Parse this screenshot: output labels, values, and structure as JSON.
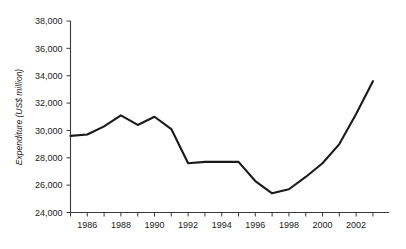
{
  "chart_data": {
    "type": "line",
    "title": "",
    "subtitle": "",
    "xlabel": "",
    "ylabel": "Expenditure (US$ million)",
    "x": [
      1985,
      1986,
      1987,
      1988,
      1989,
      1990,
      1991,
      1992,
      1993,
      1994,
      1995,
      1996,
      1997,
      1998,
      1999,
      2000,
      2001,
      2002,
      2003
    ],
    "values": [
      29600,
      29700,
      30300,
      31100,
      30400,
      31000,
      30100,
      27600,
      27700,
      27700,
      27700,
      26300,
      25400,
      25700,
      26600,
      27600,
      29000,
      31200,
      33600
    ],
    "series": [
      {
        "name": "Expenditure",
        "values": [
          29600,
          29700,
          30300,
          31100,
          30400,
          31000,
          30100,
          27600,
          27700,
          27700,
          27700,
          26300,
          25400,
          25700,
          26600,
          27600,
          29000,
          31200,
          33600
        ],
        "color": "#1a1a1a"
      }
    ],
    "xlim": [
      1985,
      2003.6
    ],
    "ylim": [
      24000,
      38000
    ],
    "ytick_values": [
      24000,
      26000,
      28000,
      30000,
      32000,
      34000,
      36000,
      38000
    ],
    "ytick_labels": [
      "24,000",
      "26,000",
      "28,000",
      "30,000",
      "32,000",
      "34,000",
      "36,000",
      "38,000"
    ],
    "xtick_values": [
      1986,
      1988,
      1990,
      1992,
      1994,
      1996,
      1998,
      2000,
      2002
    ],
    "xtick_labels": [
      "1986",
      "1988",
      "1990",
      "1992",
      "1994",
      "1996",
      "1998",
      "2000",
      "2002"
    ],
    "xminor_tick_values": [
      1985,
      1987,
      1989,
      1991,
      1993,
      1995,
      1997,
      1999,
      2001,
      2003
    ],
    "grid": false,
    "legend": "none",
    "line_color": "#1a1a1a",
    "axis_color": "#3a3a3a",
    "background_color": "#ffffff",
    "annotations": []
  }
}
